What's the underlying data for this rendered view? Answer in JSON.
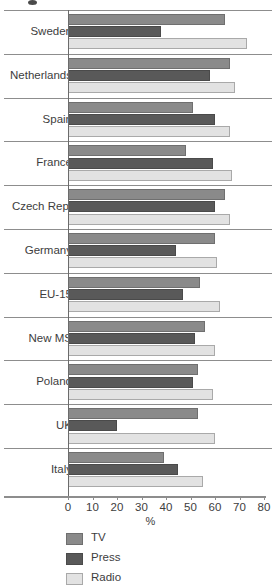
{
  "chart_data": {
    "type": "bar",
    "orientation": "horizontal",
    "title": "",
    "xlabel": "%",
    "ylabel": "",
    "xlim": [
      0,
      80
    ],
    "xticks": [
      0,
      10,
      20,
      30,
      40,
      50,
      60,
      70,
      80
    ],
    "grid": false,
    "legend_position": "bottom-left",
    "categories": [
      "Sweden",
      "Netherlands",
      "Spain",
      "France",
      "Czech Rep.",
      "Germany",
      "EU-15",
      "New MS",
      "Poland",
      "UK",
      "Italy"
    ],
    "series": [
      {
        "name": "TV",
        "color": "#8a8a8a",
        "values": [
          64,
          66,
          51,
          48,
          64,
          60,
          54,
          56,
          53,
          53,
          39
        ]
      },
      {
        "name": "Press",
        "color": "#595959",
        "values": [
          38,
          58,
          60,
          59,
          60,
          44,
          47,
          52,
          51,
          20,
          45
        ]
      },
      {
        "name": "Radio",
        "color": "#e2e2e2",
        "values": [
          73,
          68,
          66,
          67,
          66,
          61,
          62,
          60,
          59,
          60,
          55
        ]
      }
    ]
  },
  "legend": {
    "items": [
      {
        "label": "TV",
        "swatch": "tv"
      },
      {
        "label": "Press",
        "swatch": "press"
      },
      {
        "label": "Radio",
        "swatch": "radio"
      }
    ]
  }
}
